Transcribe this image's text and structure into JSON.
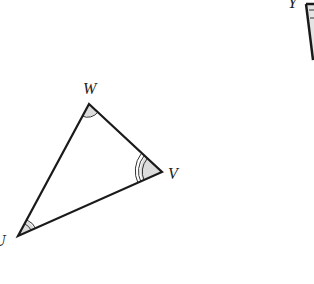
{
  "diagram": {
    "triangle_uvw": {
      "vertices": {
        "W": {
          "label": "W",
          "x": 89,
          "y": 104
        },
        "V": {
          "label": "V",
          "x": 162,
          "y": 172
        },
        "U": {
          "label": "U",
          "x": 18,
          "y": 236
        }
      },
      "angle_marks": {
        "W": 1,
        "V": 3,
        "U": 2
      }
    },
    "partial_figure": {
      "vertex_label": "Y"
    },
    "colors": {
      "stroke": "#1a1a1a",
      "angle_fill": "#d9d9d9"
    }
  }
}
